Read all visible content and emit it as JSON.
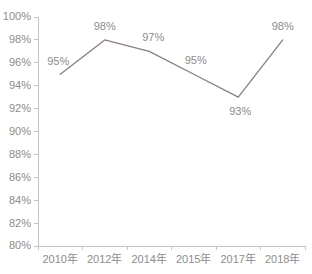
{
  "chart_data": {
    "type": "line",
    "title": "",
    "subtitle": "",
    "xlabel": "",
    "ylabel": "",
    "categories": [
      "2010年",
      "2012年",
      "2014年",
      "2015年",
      "2017年",
      "2018年"
    ],
    "values": [
      95,
      98,
      97,
      95,
      93,
      98
    ],
    "point_labels": [
      "95%",
      "98%",
      "97%",
      "95%",
      "93%",
      "98%"
    ],
    "ylim": [
      80,
      100
    ],
    "ystep": 2,
    "ytick_labels": [
      "100%",
      "98%",
      "96%",
      "94%",
      "92%",
      "90%",
      "88%",
      "86%",
      "84%",
      "82%",
      "80%"
    ],
    "ytick_values": [
      100,
      98,
      96,
      94,
      92,
      90,
      88,
      86,
      84,
      82,
      80
    ],
    "grid": false,
    "legend": false,
    "legend_position": "none",
    "markers": false,
    "unit": "%"
  },
  "style": {
    "line_color": "#8a7f78",
    "label_color": "#8c8c8c",
    "axis_color": "#c4c4c4",
    "background": "#ffffff"
  },
  "label_offsets": [
    {
      "dx": -2,
      "dy": -9
    },
    {
      "dx": 0,
      "dy": -10
    },
    {
      "dx": 4,
      "dy": -10
    },
    {
      "dx": 2,
      "dy": -10
    },
    {
      "dx": 2,
      "dy": 18
    },
    {
      "dx": 0,
      "dy": -10
    }
  ]
}
